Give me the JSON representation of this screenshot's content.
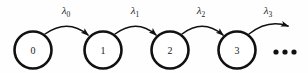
{
  "figure": {
    "background_color": "#fefefe",
    "stroke_color": "#111111",
    "states": [
      {
        "id": "s0",
        "label": "0",
        "cx": 33,
        "cy": 50,
        "r": 18.5
      },
      {
        "id": "s1",
        "label": "1",
        "cx": 103,
        "cy": 50,
        "r": 18.5
      },
      {
        "id": "s2",
        "label": "2",
        "cx": 170,
        "cy": 50,
        "r": 18.5
      },
      {
        "id": "s3",
        "label": "3",
        "cx": 237,
        "cy": 50,
        "r": 18.5
      }
    ],
    "transitions": [
      {
        "id": "t0",
        "symbol": "λ",
        "subscript": "0",
        "from": "0",
        "to": "1",
        "label_x": 66,
        "label_y": 14
      },
      {
        "id": "t1",
        "symbol": "λ",
        "subscript": "1",
        "from": "1",
        "to": "2",
        "label_x": 135,
        "label_y": 14
      },
      {
        "id": "t2",
        "symbol": "λ",
        "subscript": "2",
        "from": "2",
        "to": "3",
        "label_x": 201,
        "label_y": 14
      },
      {
        "id": "t3",
        "symbol": "λ",
        "subscript": "3",
        "from": "3",
        "to": "",
        "label_x": 268,
        "label_y": 14
      }
    ],
    "ellipsis": {
      "text": "•••",
      "dots": [
        {
          "cx": 276,
          "cy": 52,
          "r": 2.6
        },
        {
          "cx": 285,
          "cy": 52,
          "r": 2.6
        },
        {
          "cx": 294,
          "cy": 52,
          "r": 2.6
        }
      ]
    }
  }
}
